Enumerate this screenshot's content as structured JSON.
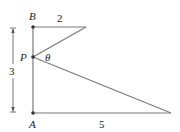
{
  "diagram": {
    "points": {
      "B": {
        "label": "B",
        "x": 33,
        "y": 27
      },
      "P": {
        "label": "P",
        "x": 33,
        "y": 57
      },
      "A": {
        "label": "A",
        "x": 33,
        "y": 113
      },
      "top_right": {
        "x": 86,
        "y": 27
      },
      "bottom_right": {
        "x": 171,
        "y": 113
      }
    },
    "labels": {
      "top_length": "2",
      "bottom_length": "5",
      "height": "3",
      "angle": "θ"
    },
    "colors": {
      "line": "#7a7a7a",
      "point": "#333333",
      "text": "#222222"
    }
  }
}
